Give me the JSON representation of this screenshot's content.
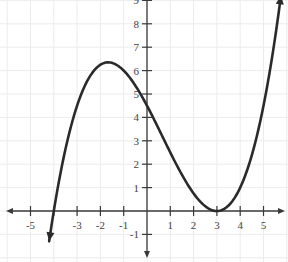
{
  "chart_data": {
    "type": "line",
    "title": "",
    "xlabel": "",
    "ylabel": "",
    "xlim": [
      -6,
      6
    ],
    "ylim": [
      -1.5,
      9
    ],
    "grid": true,
    "x_ticks": [
      -5,
      -3,
      -2,
      -1,
      1,
      2,
      3,
      4,
      5
    ],
    "x_tick_labels": [
      "-5",
      "-3",
      "-2",
      "-1",
      "1",
      "2",
      "3",
      "4",
      "5"
    ],
    "y_ticks": [
      -1,
      1,
      2,
      3,
      4,
      5,
      6,
      7,
      8,
      9
    ],
    "y_tick_labels": [
      "-1",
      "1",
      "2",
      "3",
      "4",
      "5",
      "6",
      "7",
      "8",
      "9"
    ],
    "series": [
      {
        "name": "f(x)",
        "description": "cubic with root at x=-4 and double root at x=3, f(x)=0.125(x+4)(x-3)^2",
        "x": [
          -4.2,
          -4,
          -3.5,
          -3,
          -2.5,
          -2,
          -1.67,
          -1.5,
          -1,
          -0.5,
          0,
          0.5,
          1,
          1.5,
          2,
          2.5,
          3,
          3.5,
          4,
          4.5,
          5,
          5.5,
          5.75
        ],
        "y": [
          -1.8,
          0,
          1.8,
          4.5,
          5.6,
          6.3,
          6.35,
          6.3,
          6.0,
          5.4,
          4.5,
          3.5,
          2.5,
          1.56,
          0.75,
          0.2,
          0,
          0.23,
          1.0,
          2.4,
          4.5,
          7.4,
          9.2
        ],
        "ends_with_arrows": true
      }
    ],
    "key_points": {
      "local_max": [
        -1.67,
        6.35
      ],
      "roots": [
        -4,
        3
      ],
      "y_intercept": 4.5
    }
  }
}
